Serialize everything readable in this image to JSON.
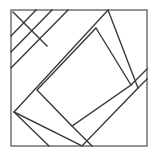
{
  "figure": {
    "title": "geometric-line-figure",
    "description": "Square frame subdivided by a rotated square (diamond), an inner rotated rectangle, and three parallel diagonal strips in the upper-left corner",
    "canvas": {
      "width": 159,
      "height": 158,
      "background": "#ffffff"
    },
    "frame": {
      "name": "outer-square-frame",
      "x": 11,
      "y": 10,
      "width": 136,
      "height": 136,
      "stroke": "#7a7a7a",
      "stroke_width": 1.6,
      "fill": "#ffffff"
    },
    "stroke": {
      "color": "#3a3a3a",
      "width": 1.4
    },
    "shapes": [
      {
        "name": "outer-diamond",
        "type": "polygon",
        "points": "108,10 138,88 82,146 14,112"
      },
      {
        "name": "inner-rotated-rectangle",
        "type": "polygon",
        "points": "96,28 131,85 72,126 37,90"
      }
    ],
    "lines": [
      {
        "name": "diagonal-strip-1",
        "x1": 13,
        "y1": 12,
        "x2": 47,
        "y2": 46
      },
      {
        "name": "diagonal-strip-2",
        "x1": 36,
        "y1": 10,
        "x2": 11,
        "y2": 36
      },
      {
        "name": "diagonal-strip-3",
        "x1": 52,
        "y1": 10,
        "x2": 11,
        "y2": 52
      },
      {
        "name": "diagonal-strip-4",
        "x1": 68,
        "y1": 10,
        "x2": 11,
        "y2": 68
      },
      {
        "name": "diamond-to-bottom-left",
        "x1": 14,
        "y1": 112,
        "x2": 49,
        "y2": 146
      },
      {
        "name": "diamond-to-right-edge",
        "x1": 138,
        "y1": 88,
        "x2": 147,
        "y2": 79
      },
      {
        "name": "inner-rect-right-extension",
        "x1": 131,
        "y1": 85,
        "x2": 147,
        "y2": 69
      },
      {
        "name": "inner-rect-bottom-extension",
        "x1": 72,
        "y1": 126,
        "x2": 92,
        "y2": 146
      }
    ]
  }
}
